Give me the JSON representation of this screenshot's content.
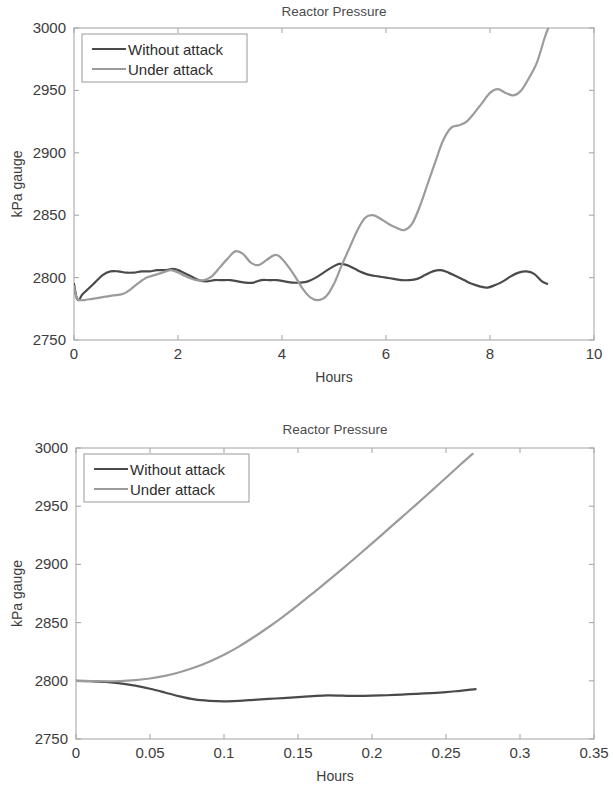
{
  "page": {
    "background_color": "#ffffff"
  },
  "figures": [
    {
      "id": "top",
      "title": "Reactor Pressure",
      "xlabel": "Hours",
      "ylabel": "kPa gauge",
      "legend": {
        "position": "top-left",
        "entries": [
          {
            "label": "Without attack",
            "color": "#4a4a4a"
          },
          {
            "label": "Under attack",
            "color": "#9b9b9b"
          }
        ]
      }
    },
    {
      "id": "bottom",
      "title": "Reactor Pressure",
      "xlabel": "Hours",
      "ylabel": "kPa gauge",
      "legend": {
        "position": "top-left",
        "entries": [
          {
            "label": "Without attack",
            "color": "#4a4a4a"
          },
          {
            "label": "Under attack",
            "color": "#9b9b9b"
          }
        ]
      }
    }
  ],
  "chart_data": [
    {
      "id": "top",
      "type": "line",
      "title": "Reactor Pressure",
      "xlabel": "Hours",
      "ylabel": "kPa gauge",
      "xlim": [
        0,
        10
      ],
      "ylim": [
        2750,
        3000
      ],
      "xticks": [
        0,
        2,
        4,
        6,
        8,
        10
      ],
      "xticklabels": [
        "0",
        "2",
        "4",
        "6",
        "8",
        "10"
      ],
      "yticks": [
        2750,
        2800,
        2850,
        2900,
        2950,
        3000
      ],
      "yticklabels": [
        "2750",
        "2800",
        "2850",
        "2900",
        "2950",
        "3000"
      ],
      "grid": false,
      "legend_position": "top-left",
      "series": [
        {
          "name": "Without attack",
          "color": "#4a4a4a",
          "width": 2.2,
          "x": [
            0.0,
            0.05,
            0.1,
            0.15,
            0.25,
            0.4,
            0.55,
            0.7,
            0.85,
            1.0,
            1.15,
            1.3,
            1.45,
            1.6,
            1.75,
            1.9,
            2.0,
            2.1,
            2.25,
            2.4,
            2.55,
            2.7,
            2.85,
            3.0,
            3.15,
            3.3,
            3.45,
            3.6,
            3.75,
            3.9,
            4.05,
            4.2,
            4.35,
            4.5,
            4.65,
            4.8,
            4.95,
            5.1,
            5.25,
            5.4,
            5.55,
            5.7,
            5.85,
            6.0,
            6.15,
            6.3,
            6.45,
            6.6,
            6.75,
            6.9,
            7.05,
            7.2,
            7.35,
            7.5,
            7.65,
            7.8,
            7.95,
            8.1,
            8.25,
            8.4,
            8.55,
            8.7,
            8.85,
            9.0,
            9.1
          ],
          "y": [
            2795,
            2784,
            2782,
            2786,
            2790,
            2796,
            2802,
            2805,
            2805,
            2804,
            2804,
            2805,
            2805,
            2806,
            2806,
            2807,
            2806,
            2804,
            2801,
            2798,
            2797,
            2798,
            2798,
            2798,
            2797,
            2796,
            2796,
            2798,
            2798,
            2798,
            2797,
            2796,
            2796,
            2797,
            2800,
            2804,
            2808,
            2811,
            2810,
            2807,
            2804,
            2802,
            2801,
            2800,
            2799,
            2798,
            2798,
            2799,
            2802,
            2805,
            2806,
            2804,
            2801,
            2798,
            2795,
            2793,
            2792,
            2794,
            2797,
            2801,
            2804,
            2805,
            2803,
            2797,
            2795
          ]
        },
        {
          "name": "Under attack",
          "color": "#9b9b9b",
          "width": 2.2,
          "x": [
            0.0,
            0.05,
            0.1,
            0.2,
            0.35,
            0.5,
            0.65,
            0.8,
            0.95,
            1.1,
            1.25,
            1.4,
            1.55,
            1.7,
            1.85,
            1.95,
            2.05,
            2.2,
            2.35,
            2.5,
            2.65,
            2.8,
            2.95,
            3.1,
            3.25,
            3.4,
            3.55,
            3.7,
            3.85,
            3.95,
            4.1,
            4.25,
            4.4,
            4.55,
            4.7,
            4.85,
            5.0,
            5.15,
            5.3,
            5.45,
            5.6,
            5.75,
            5.9,
            6.05,
            6.2,
            6.35,
            6.5,
            6.65,
            6.8,
            6.95,
            7.1,
            7.25,
            7.4,
            7.55,
            7.7,
            7.85,
            8.0,
            8.15,
            8.3,
            8.45,
            8.6,
            8.75,
            8.9,
            9.05,
            9.12
          ],
          "y": [
            2793,
            2784,
            2782,
            2782,
            2783,
            2784,
            2785,
            2786,
            2787,
            2791,
            2796,
            2800,
            2802,
            2804,
            2806,
            2805,
            2803,
            2800,
            2798,
            2798,
            2801,
            2808,
            2815,
            2821,
            2819,
            2812,
            2810,
            2814,
            2818,
            2817,
            2810,
            2801,
            2791,
            2784,
            2782,
            2785,
            2795,
            2810,
            2824,
            2838,
            2848,
            2850,
            2847,
            2843,
            2840,
            2838,
            2843,
            2857,
            2875,
            2893,
            2910,
            2920,
            2922,
            2925,
            2932,
            2940,
            2948,
            2951,
            2948,
            2946,
            2950,
            2960,
            2972,
            2992,
            3000
          ]
        }
      ]
    },
    {
      "id": "bottom",
      "type": "line",
      "title": "Reactor Pressure",
      "xlabel": "Hours",
      "ylabel": "kPa gauge",
      "xlim": [
        0,
        0.35
      ],
      "ylim": [
        2750,
        3000
      ],
      "xticks": [
        0,
        0.05,
        0.1,
        0.15,
        0.2,
        0.25,
        0.3,
        0.35
      ],
      "xticklabels": [
        "0",
        "0.05",
        "0.1",
        "0.15",
        "0.2",
        "0.25",
        "0.3",
        "0.35"
      ],
      "yticks": [
        2750,
        2800,
        2850,
        2900,
        2950,
        3000
      ],
      "yticklabels": [
        "2750",
        "2800",
        "2850",
        "2900",
        "2950",
        "3000"
      ],
      "grid": false,
      "legend_position": "top-left",
      "series": [
        {
          "name": "Without attack",
          "color": "#4a4a4a",
          "width": 2.2,
          "x": [
            0.0,
            0.01,
            0.02,
            0.03,
            0.04,
            0.05,
            0.06,
            0.07,
            0.08,
            0.09,
            0.1,
            0.11,
            0.12,
            0.13,
            0.14,
            0.15,
            0.16,
            0.17,
            0.18,
            0.19,
            0.2,
            0.21,
            0.22,
            0.23,
            0.24,
            0.25,
            0.258,
            0.265,
            0.27
          ],
          "y": [
            2800.0,
            2799.6,
            2799.0,
            2797.8,
            2795.8,
            2793.2,
            2790.0,
            2786.6,
            2784.0,
            2782.8,
            2782.4,
            2782.8,
            2783.6,
            2784.4,
            2785.2,
            2786.0,
            2786.8,
            2787.4,
            2787.2,
            2787.0,
            2787.2,
            2787.6,
            2788.2,
            2788.8,
            2789.4,
            2790.2,
            2791.2,
            2792.2,
            2792.8
          ]
        },
        {
          "name": "Under attack",
          "color": "#9b9b9b",
          "width": 2.2,
          "x": [
            0.0,
            0.01,
            0.02,
            0.03,
            0.04,
            0.05,
            0.06,
            0.07,
            0.08,
            0.09,
            0.1,
            0.11,
            0.12,
            0.13,
            0.14,
            0.15,
            0.16,
            0.17,
            0.18,
            0.19,
            0.2,
            0.21,
            0.22,
            0.23,
            0.24,
            0.25,
            0.26,
            0.268
          ],
          "y": [
            2800.0,
            2799.8,
            2799.6,
            2799.8,
            2800.6,
            2802.0,
            2804.2,
            2807.4,
            2811.4,
            2816.4,
            2822.4,
            2829.4,
            2837.4,
            2846.0,
            2855.2,
            2865.0,
            2875.2,
            2885.6,
            2896.2,
            2907.0,
            2918.0,
            2929.2,
            2940.4,
            2951.6,
            2963.0,
            2974.4,
            2986.0,
            2995.0
          ]
        }
      ]
    }
  ]
}
